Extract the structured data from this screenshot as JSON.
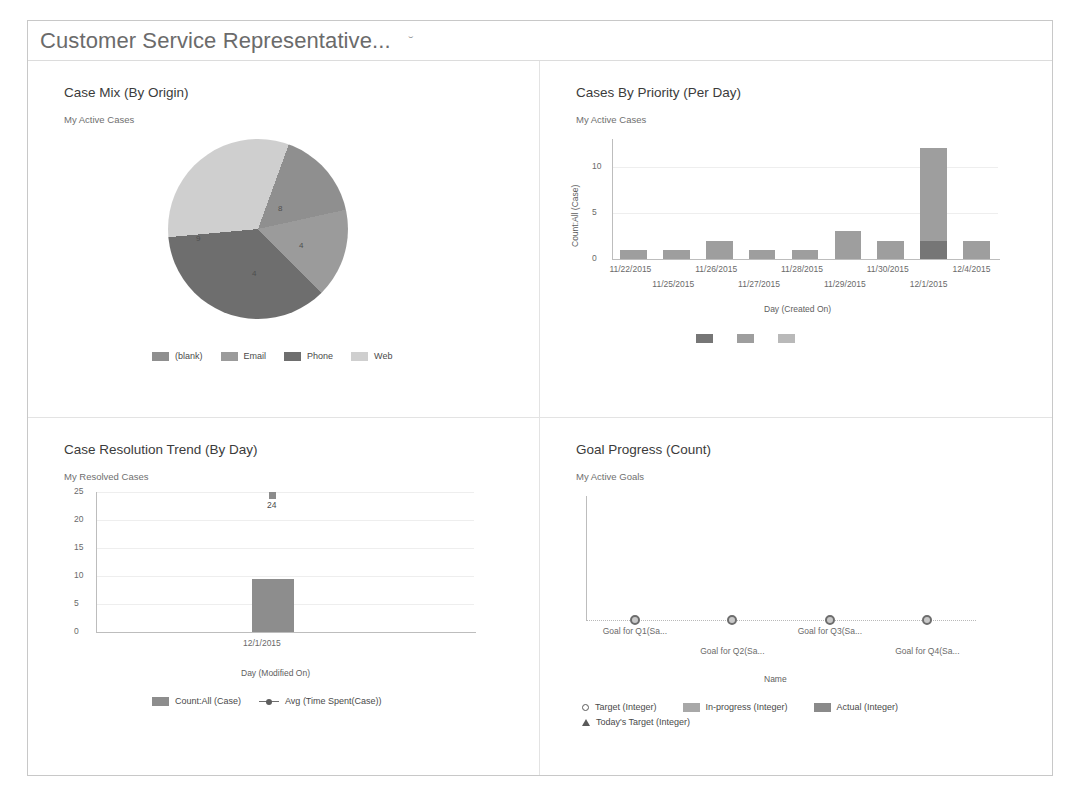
{
  "header": {
    "title": "Customer Service Representative...",
    "caret": "ˇ"
  },
  "panels": [
    {
      "title": "Case Mix (By Origin)",
      "subtitle": "My Active Cases",
      "chart": {
        "legend": [
          "(blank)",
          "Email",
          "Phone",
          "Web"
        ],
        "slice_labels": [
          "8",
          "4",
          "4",
          "9"
        ]
      }
    },
    {
      "title": "Cases By Priority (Per Day)",
      "subtitle": "My Active Cases",
      "chart": {
        "xlabel": "Day (Created On)",
        "ylabel": "Count:All (Case)"
      }
    },
    {
      "title": "Case Resolution Trend (By Day)",
      "subtitle": "My Resolved Cases",
      "chart": {
        "xlabel": "Day (Modified On)",
        "categories": [
          "12/1/2015"
        ],
        "point_label": "24",
        "legend": [
          "Count:All (Case)",
          "Avg (Time Spent(Case))"
        ]
      }
    },
    {
      "title": "Goal Progress (Count)",
      "subtitle": "My Active Goals",
      "chart": {
        "xlabel": "Name",
        "legend": [
          "Target (Integer)",
          "In-progress (Integer)",
          "Actual (Integer)",
          "Today's Target (Integer)"
        ]
      }
    }
  ],
  "chart_data": [
    {
      "type": "pie",
      "title": "Case Mix (By Origin)",
      "subtitle": "My Active Cases",
      "labels": [
        "(blank)",
        "Email",
        "Phone",
        "Web"
      ],
      "values": [
        4,
        4,
        9,
        8
      ],
      "colors": [
        "#8f8f8f",
        "#9b9b9b",
        "#6e6e6e",
        "#cfcfcf"
      ],
      "legend_position": "bottom"
    },
    {
      "type": "bar",
      "title": "Cases By Priority (Per Day)",
      "subtitle": "My Active Cases",
      "xlabel": "Day (Created On)",
      "ylabel": "Count:All (Case)",
      "categories": [
        "11/22/2015",
        "11/25/2015",
        "11/26/2015",
        "11/27/2015",
        "11/28/2015",
        "11/29/2015",
        "11/30/2015",
        "12/1/2015",
        "12/4/2015"
      ],
      "series": [
        {
          "name": "Low",
          "values": [
            0,
            0,
            0,
            0,
            0,
            0,
            0,
            2,
            0
          ],
          "color": "#767676"
        },
        {
          "name": "Normal",
          "values": [
            1,
            1,
            2,
            1,
            1,
            3,
            2,
            10,
            2
          ],
          "color": "#9e9e9e"
        },
        {
          "name": "High",
          "values": [
            0,
            0,
            0,
            0,
            0,
            0,
            0,
            0,
            0
          ],
          "color": "#b9b9b9"
        }
      ],
      "totals": [
        1,
        1,
        2,
        1,
        1,
        3,
        2,
        12,
        2
      ],
      "yticks": [
        0,
        5,
        10
      ],
      "ylim": [
        0,
        13
      ],
      "grid": true,
      "stacked": true,
      "legend_position": "bottom"
    },
    {
      "type": "bar",
      "title": "Case Resolution Trend (By Day)",
      "subtitle": "My Resolved Cases",
      "xlabel": "Day (Modified On)",
      "categories": [
        "12/1/2015"
      ],
      "series": [
        {
          "name": "Count:All (Case)",
          "values": [
            9
          ],
          "color": "#8d8d8d"
        },
        {
          "name": "Avg (Time Spent(Case))",
          "values": [
            24
          ],
          "type": "line",
          "color": "#8c8c8c"
        }
      ],
      "yticks": [
        0,
        5,
        10,
        15,
        20,
        25
      ],
      "ylim": [
        0,
        25
      ],
      "data_labels": [
        "24"
      ],
      "grid": true,
      "legend_position": "bottom"
    },
    {
      "type": "scatter",
      "title": "Goal Progress (Count)",
      "subtitle": "My Active Goals",
      "xlabel": "Name",
      "categories": [
        "Goal for Q1(Sa...",
        "Goal for Q2(Sa...",
        "Goal for Q3(Sa...",
        "Goal for Q4(Sa..."
      ],
      "series": [
        {
          "name": "Target (Integer)",
          "values": [
            0,
            0,
            0,
            0
          ],
          "marker": "circle"
        },
        {
          "name": "In-progress (Integer)",
          "values": [
            0,
            0,
            0,
            0
          ],
          "color": "#a8a8a8"
        },
        {
          "name": "Actual (Integer)",
          "values": [
            0,
            0,
            0,
            0
          ],
          "color": "#8a8a8a"
        },
        {
          "name": "Today's Target (Integer)",
          "values": [
            0,
            0,
            0,
            0
          ],
          "marker": "triangle"
        }
      ],
      "ylim": [
        0,
        1
      ],
      "grid": false,
      "legend_position": "bottom"
    }
  ]
}
